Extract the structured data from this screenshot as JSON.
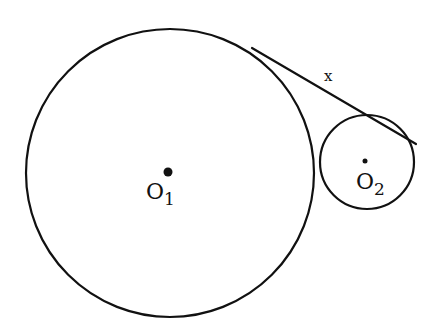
{
  "diagram": {
    "type": "geometry",
    "stroke_color": "#111111",
    "background": "#ffffff",
    "circles": [
      {
        "id": "large",
        "center_label": "O",
        "center_subscript": "1",
        "cx": 170,
        "cy": 173,
        "r": 144
      },
      {
        "id": "small",
        "center_label": "O",
        "center_subscript": "2",
        "cx": 367,
        "cy": 162,
        "r": 47
      }
    ],
    "tangent_segment": {
      "label": "x",
      "from": [
        262,
        54
      ],
      "to": [
        411,
        140
      ]
    }
  }
}
